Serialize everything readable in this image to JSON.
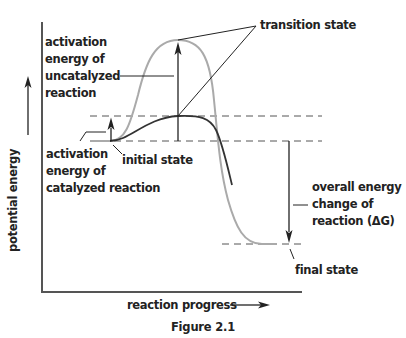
{
  "figure": {
    "caption": "Figure 2.1",
    "type": "energy diagram"
  },
  "axes": {
    "y_label": "potential energy",
    "x_label": "reaction progress"
  },
  "labels": {
    "transition_state": "transition state",
    "activation_uncatalyzed": [
      "activation",
      "energy of",
      "uncatalyzed",
      "reaction"
    ],
    "activation_catalyzed": [
      "activation",
      "energy of",
      "catalyzed reaction"
    ],
    "initial_state": "initial state",
    "overall_energy_change": [
      "overall energy",
      "change of",
      "reaction (ΔG)"
    ],
    "final_state": "final state"
  },
  "curves": [
    {
      "name": "uncatalyzed reaction",
      "color": "#aaaaaa"
    },
    {
      "name": "catalyzed reaction",
      "color": "#333333"
    }
  ],
  "colors": {
    "ink": "#222222",
    "uncatalyzed": "#aaaaaa",
    "catalyzed": "#333333",
    "dashed": "#555555"
  }
}
